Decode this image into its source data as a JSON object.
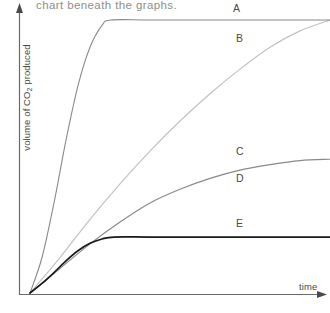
{
  "instruction": {
    "text": "chart beneath the graphs."
  },
  "axes": {
    "y_label_prefix": "volume of CO",
    "y_label_sub": "2",
    "y_label_suffix": " produced",
    "x_label": "time"
  },
  "curve_labels": {
    "a": "A",
    "b": "B",
    "c": "C",
    "d": "D",
    "e": "E"
  },
  "colors": {
    "axis": "#6b6b6b",
    "instruction_text": "#8e8e8e",
    "label_text": "#4a4a4a",
    "curve_a": "#8a8a8a",
    "curve_b": "#c2c2c2",
    "curve_c": "#8a8a8a",
    "curve_d": "#9a9a9a",
    "curve_e": "#1a1a1a",
    "background": "#ffffff"
  },
  "chart_data": {
    "type": "line",
    "title": "",
    "xlabel": "time",
    "ylabel": "volume of CO2 produced",
    "xlim": [
      0,
      1
    ],
    "ylim": [
      0,
      1
    ],
    "grid": false,
    "legend": "inline-end-labels",
    "axis_ticks": false,
    "axis_arrows": {
      "x": "right",
      "y": "up"
    },
    "series": [
      {
        "name": "A",
        "label": "A",
        "color": "#8a8a8a",
        "final_level": 1.0,
        "rate": "fastest",
        "plateau_reached_at_x": 0.27,
        "x": [
          0.0,
          0.04,
          0.08,
          0.12,
          0.16,
          0.2,
          0.24,
          0.27,
          0.4,
          0.6,
          0.8,
          1.0
        ],
        "y": [
          0.0,
          0.13,
          0.33,
          0.56,
          0.76,
          0.9,
          0.98,
          1.0,
          1.0,
          1.0,
          1.0,
          1.0
        ]
      },
      {
        "name": "B",
        "label": "B",
        "color": "#c2c2c2",
        "final_level": 1.0,
        "rate": "slow",
        "plateau_reached_at_x": 1.0,
        "x": [
          0.0,
          0.1,
          0.2,
          0.3,
          0.4,
          0.5,
          0.6,
          0.7,
          0.8,
          0.9,
          1.0
        ],
        "y": [
          0.0,
          0.13,
          0.27,
          0.4,
          0.52,
          0.63,
          0.73,
          0.82,
          0.9,
          0.96,
          1.0
        ]
      },
      {
        "name": "C",
        "label": "C",
        "color": "#8a8a8a",
        "final_level": 0.49,
        "rate": "medium",
        "plateau_reached_at_x": 0.95,
        "x": [
          0.0,
          0.1,
          0.2,
          0.3,
          0.4,
          0.5,
          0.6,
          0.7,
          0.8,
          0.9,
          1.0
        ],
        "y": [
          0.0,
          0.09,
          0.18,
          0.26,
          0.33,
          0.38,
          0.42,
          0.45,
          0.47,
          0.485,
          0.49
        ]
      },
      {
        "name": "D",
        "label": "D",
        "color": "#9a9a9a",
        "final_level": 0.49,
        "rate": "medium",
        "note": "label D sits beneath the same rising curve as C"
      },
      {
        "name": "E",
        "label": "E",
        "color": "#1a1a1a",
        "final_level": 0.205,
        "rate": "fast",
        "plateau_reached_at_x": 0.28,
        "x": [
          0.0,
          0.04,
          0.08,
          0.12,
          0.16,
          0.2,
          0.24,
          0.28,
          0.4,
          0.6,
          0.8,
          1.0
        ],
        "y": [
          0.0,
          0.035,
          0.075,
          0.118,
          0.155,
          0.182,
          0.198,
          0.205,
          0.205,
          0.205,
          0.205,
          0.205
        ]
      }
    ]
  }
}
